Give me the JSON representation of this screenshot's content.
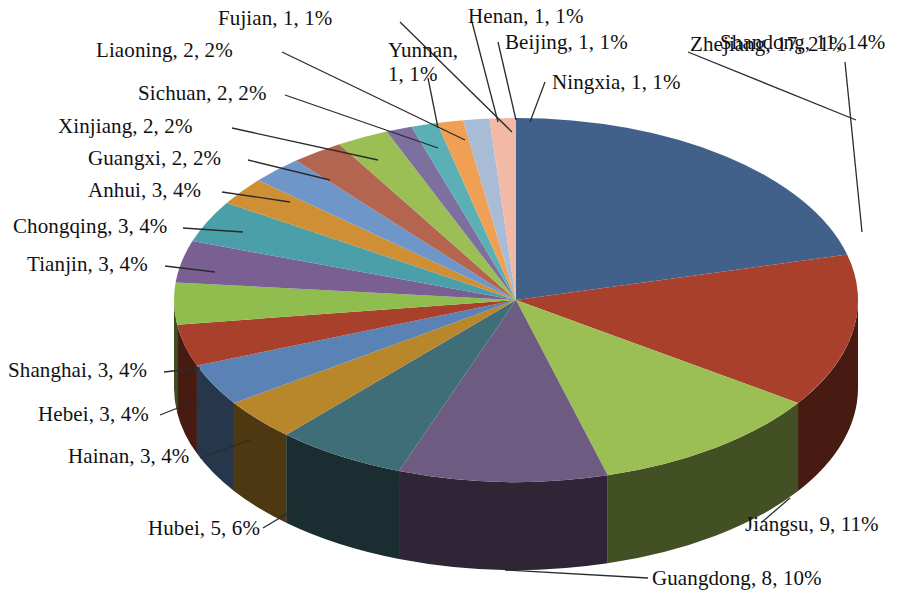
{
  "chart_data": {
    "type": "pie",
    "title": "",
    "subtitle": "",
    "xlabel": "",
    "ylabel": "",
    "legend_position": "none",
    "grid": false,
    "label_format": "name, value, percent",
    "total": 81,
    "start_angle_deg": 0,
    "direction": "clockwise",
    "three_d": true,
    "categories": [
      "Zhejiang",
      "Shandong",
      "Jiangsu",
      "Guangdong",
      "Hubei",
      "Hainan",
      "Hebei",
      "Shanghai",
      "Tianjin",
      "Chongqing",
      "Anhui",
      "Guangxi",
      "Xinjiang",
      "Sichuan",
      "Liaoning",
      "Fujian",
      "Yunnan",
      "Henan",
      "Beijing",
      "Ningxia"
    ],
    "values": [
      17,
      11,
      9,
      8,
      5,
      3,
      3,
      3,
      3,
      3,
      3,
      2,
      2,
      2,
      2,
      1,
      1,
      1,
      1,
      1
    ],
    "percents": [
      21,
      14,
      11,
      10,
      6,
      4,
      4,
      4,
      4,
      4,
      4,
      2,
      2,
      2,
      2,
      1,
      1,
      1,
      1,
      1
    ],
    "colors": [
      "#41618a",
      "#a8402b",
      "#9cbf55",
      "#6d5b81",
      "#3f6d78",
      "#b8862b",
      "#5b82b4",
      "#4aa3a8",
      "#8fbd4e",
      "#7a5f93",
      "#4a9fa8",
      "#cf8f35",
      "#6f96c9",
      "#b4654f",
      "#9cbf55",
      "#7d6f9e",
      "#5bb0b6",
      "#f0a055",
      "#a8bcd6",
      "#f2b9a6"
    ],
    "slices": [
      {
        "name": "Zhejiang",
        "value": 17,
        "percent": 21,
        "label": "Zhejiang, 17, 21%",
        "color": "#41618a"
      },
      {
        "name": "Shandong",
        "value": 11,
        "percent": 14,
        "label": "Shandong, 11, 14%",
        "color": "#a8402b"
      },
      {
        "name": "Jiangsu",
        "value": 9,
        "percent": 11,
        "label": "Jiangsu, 9, 11%",
        "color": "#9cbf55"
      },
      {
        "name": "Guangdong",
        "value": 8,
        "percent": 10,
        "label": "Guangdong, 8, 10%",
        "color": "#6d5b81"
      },
      {
        "name": "Hubei",
        "value": 5,
        "percent": 6,
        "label": "Hubei, 5, 6%",
        "color": "#3f6d78"
      },
      {
        "name": "Hainan",
        "value": 3,
        "percent": 4,
        "label": "Hainan, 3, 4%",
        "color": "#b8862b"
      },
      {
        "name": "Hebei",
        "value": 3,
        "percent": 4,
        "label": "Hebei, 3, 4%",
        "color": "#5b82b4"
      },
      {
        "name": "Shanghai",
        "value": 3,
        "percent": 4,
        "label": "Shanghai, 3, 4%",
        "color": "#a8402b"
      },
      {
        "name": "Tianjin",
        "value": 3,
        "percent": 4,
        "label": "Tianjin, 3, 4%",
        "color": "#8fbd4e"
      },
      {
        "name": "Chongqing",
        "value": 3,
        "percent": 4,
        "label": "Chongqing, 3, 4%",
        "color": "#7a5f93"
      },
      {
        "name": "Anhui",
        "value": 3,
        "percent": 4,
        "label": "Anhui, 3, 4%",
        "color": "#4a9fa8"
      },
      {
        "name": "Guangxi",
        "value": 2,
        "percent": 2,
        "label": "Guangxi, 2, 2%",
        "color": "#cf8f35"
      },
      {
        "name": "Xinjiang",
        "value": 2,
        "percent": 2,
        "label": "Xinjiang, 2, 2%",
        "color": "#6f96c9"
      },
      {
        "name": "Sichuan",
        "value": 2,
        "percent": 2,
        "label": "Sichuan, 2, 2%",
        "color": "#b4654f"
      },
      {
        "name": "Liaoning",
        "value": 2,
        "percent": 2,
        "label": "Liaoning, 2, 2%",
        "color": "#9cbf55"
      },
      {
        "name": "Fujian",
        "value": 1,
        "percent": 1,
        "label": "Fujian, 1, 1%",
        "color": "#7d6f9e"
      },
      {
        "name": "Yunnan",
        "value": 1,
        "percent": 1,
        "label": "Yunnan, 1, 1%",
        "color": "#5bb0b6"
      },
      {
        "name": "Henan",
        "value": 1,
        "percent": 1,
        "label": "Henan, 1, 1%",
        "color": "#f0a055"
      },
      {
        "name": "Beijing",
        "value": 1,
        "percent": 1,
        "label": "Beijing, 1, 1%",
        "color": "#a8bcd6"
      },
      {
        "name": "Ningxia",
        "value": 1,
        "percent": 1,
        "label": "Ningxia, 1, 1%",
        "color": "#f2b9a6"
      }
    ]
  },
  "labels": {
    "fujian": "Fujian, 1, 1%",
    "liaoning": "Liaoning, 2, 2%",
    "sichuan": "Sichuan, 2, 2%",
    "xinjiang": "Xinjiang, 2, 2%",
    "guangxi": "Guangxi, 2, 2%",
    "anhui": "Anhui, 3, 4%",
    "chongqing": "Chongqing, 3, 4%",
    "tianjin": "Tianjin, 3, 4%",
    "shanghai": "Shanghai, 3, 4%",
    "hebei": "Hebei, 3, 4%",
    "hainan": "Hainan, 3, 4%",
    "hubei": "Hubei, 5, 6%",
    "guangdong": "Guangdong, 8, 10%",
    "jiangsu": "Jiangsu, 9, 11%",
    "zhejiang": "Zhejiang, 17, 21%",
    "shandong": "Shandong, 11, 14%",
    "ningxia": "Ningxia, 1, 1%",
    "beijing": "Beijing, 1, 1%",
    "henan": "Henan, 1, 1%",
    "yunnan_l1": "Yunnan,",
    "yunnan_l2": "1, 1%"
  }
}
